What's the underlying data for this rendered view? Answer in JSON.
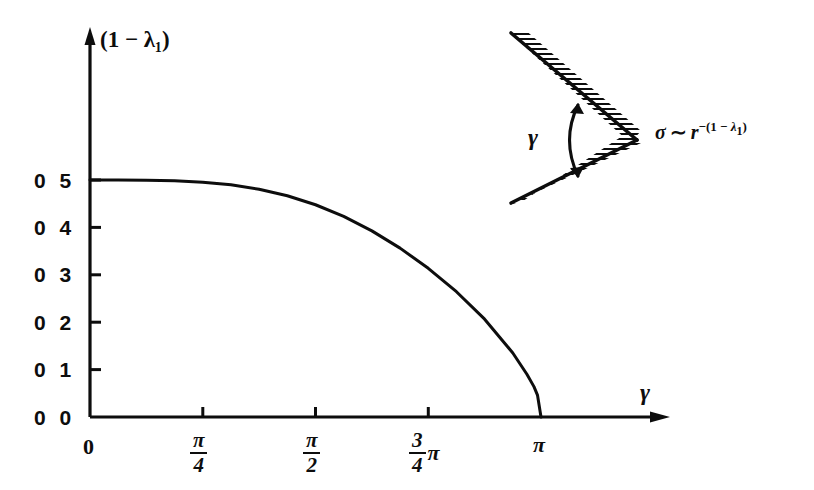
{
  "figure": {
    "background_color": "#ffffff",
    "ink_color": "#0d0d0d",
    "y_axis_label": "(1 − λ₁)",
    "x_axis_label": "γ"
  },
  "axes": {
    "y_ticks": [
      {
        "label": "0 5",
        "value": 0.5
      },
      {
        "label": "0 4",
        "value": 0.4
      },
      {
        "label": "0 3",
        "value": 0.3
      },
      {
        "label": "0 2",
        "value": 0.2
      },
      {
        "label": "0 1",
        "value": 0.1
      },
      {
        "label": "0 0",
        "value": 0.0
      }
    ],
    "x_ticks": [
      {
        "label": "0",
        "numerator": "",
        "denominator": "",
        "suffix": "",
        "value": 0.0
      },
      {
        "label": "",
        "numerator": "π",
        "denominator": "4",
        "suffix": "",
        "value": 0.785398
      },
      {
        "label": "",
        "numerator": "π",
        "denominator": "2",
        "suffix": "",
        "value": 1.570796
      },
      {
        "label": "",
        "numerator": "3",
        "denominator": "4",
        "suffix": "π",
        "value": 2.356194
      },
      {
        "label": "π",
        "numerator": "",
        "denominator": "",
        "suffix": "",
        "value": 3.141593
      }
    ]
  },
  "inset": {
    "gamma_label": "γ",
    "formula": {
      "sigma": "σ",
      "tilde": "∼",
      "base": "r",
      "exponent_minus": "−",
      "exponent_open": "(1 − ",
      "exponent_lambda": "λ",
      "exponent_lambda_sub": "1",
      "exponent_close": ")"
    },
    "hatching": "wedge-hatched-boundary",
    "description": "V-notch with opening angle gamma, hatched outer faces"
  },
  "chart_data": {
    "type": "line",
    "title": "",
    "subtitle": "",
    "xlabel": "γ",
    "ylabel": "(1 − λ₁)",
    "xlim": [
      0,
      3.141593
    ],
    "ylim": [
      0,
      0.55
    ],
    "grid": false,
    "legend": null,
    "x_tick_values": [
      0,
      0.785398,
      1.570796,
      2.356194,
      3.141593
    ],
    "x_tick_labels": [
      "0",
      "π/4",
      "π/2",
      "(3/4)π",
      "π"
    ],
    "y_tick_values": [
      0.0,
      0.1,
      0.2,
      0.3,
      0.4,
      0.5
    ],
    "y_tick_labels": [
      "0 0",
      "0 1",
      "0 2",
      "0 3",
      "0 4",
      "0 5"
    ],
    "series": [
      {
        "name": "1 - lambda_1",
        "x": [
          0.0,
          0.19635,
          0.392699,
          0.589049,
          0.785398,
          0.981748,
          1.178097,
          1.374447,
          1.570796,
          1.767146,
          1.963495,
          2.159845,
          2.356194,
          2.552544,
          2.748894,
          2.945243,
          3.043418,
          3.092505,
          3.117049,
          3.141593
        ],
        "y": [
          0.5,
          0.4999,
          0.4995,
          0.4983,
          0.4954,
          0.4898,
          0.4805,
          0.4668,
          0.4478,
          0.4232,
          0.3927,
          0.3563,
          0.3137,
          0.2643,
          0.2064,
          0.1351,
          0.0902,
          0.0641,
          0.0462,
          0.0
        ],
        "color": "#0d0d0d",
        "linewidth": 3
      }
    ],
    "annotations": [
      {
        "text": "σ ∼ r^−(1−λ₁)",
        "x_px": 650,
        "y_px": 120,
        "note": "inset formula for stress singularity"
      },
      {
        "text": "γ",
        "x_px": 553,
        "y_px": 120,
        "note": "inset notch opening angle label"
      }
    ]
  }
}
